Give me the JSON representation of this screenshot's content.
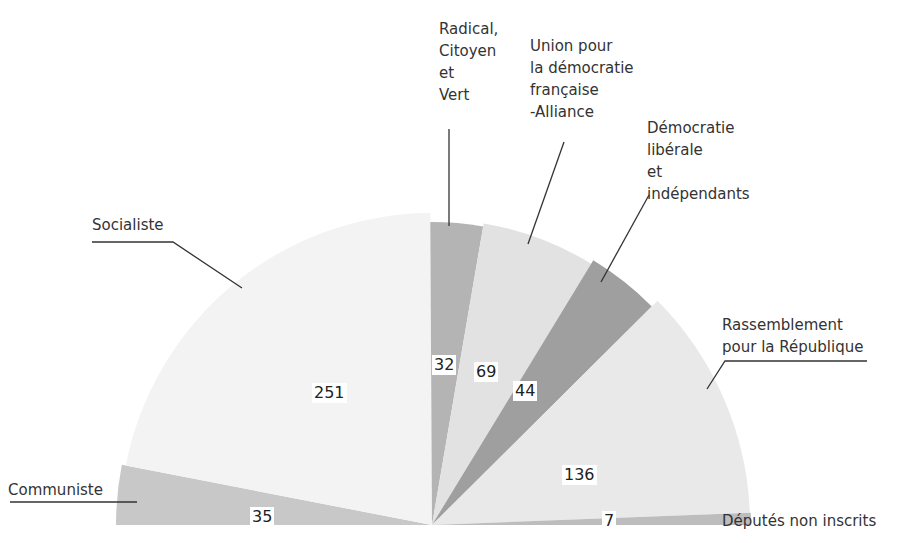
{
  "chart_data": {
    "type": "pie",
    "subtype": "half-pie (parliament seat distribution)",
    "title": "",
    "total": 574,
    "series": [
      {
        "name": "Communiste",
        "label_lines": [
          "Communiste"
        ],
        "value": 35,
        "color": "#c8c8c8"
      },
      {
        "name": "Socialiste",
        "label_lines": [
          "Socialiste"
        ],
        "value": 251,
        "color": "#f3f3f3"
      },
      {
        "name": "Radical, Citoyen et Vert",
        "label_lines": [
          "Radical,",
          "Citoyen",
          "et",
          "Vert"
        ],
        "value": 32,
        "color": "#b4b4b4"
      },
      {
        "name": "Union pour la démocratie française -Alliance",
        "label_lines": [
          "Union pour",
          "la démocratie",
          "française",
          "-Alliance"
        ],
        "value": 69,
        "color": "#e2e2e2"
      },
      {
        "name": "Démocratie libérale et indépendants",
        "label_lines": [
          "Démocratie",
          "libérale",
          "et",
          "indépendants"
        ],
        "value": 44,
        "color": "#9f9f9f"
      },
      {
        "name": "Rassemblement pour la République",
        "label_lines": [
          "Rassemblement",
          "pour la République"
        ],
        "value": 136,
        "color": "#e9e9e9"
      },
      {
        "name": "Députés non inscrits",
        "label_lines": [
          "Députés non inscrits"
        ],
        "value": 7,
        "color": "#bdbdbd"
      }
    ],
    "legend": "none (callout labels with leader lines)",
    "grid": false
  },
  "labels": {
    "communiste": "Communiste",
    "socialiste": "Socialiste",
    "rcv": "Radical,\nCitoyen\net\nVert",
    "udf": "Union pour\nla démocratie\nfrançaise\n-Alliance",
    "dl": "Démocratie\nlibérale\net\nindépendants",
    "rpr": "Rassemblement\npour la République",
    "ni": "Députés non inscrits"
  },
  "values": {
    "communiste": "35",
    "socialiste": "251",
    "rcv": "32",
    "udf": "69",
    "dl": "44",
    "rpr": "136",
    "ni": "7"
  }
}
